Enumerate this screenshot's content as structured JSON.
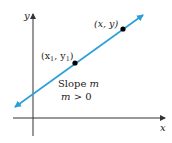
{
  "figure": {
    "axes": {
      "x_label": "x",
      "y_label": "y",
      "color": "#333333"
    },
    "line": {
      "color": "#2a9fd8",
      "direction": "positive slope, arrows both ends"
    },
    "points": [
      {
        "label_pre": "(x",
        "label_sub": "1",
        "label_mid": ", y",
        "label_sub2": "1",
        "label_post": ")"
      },
      {
        "label": "(x, y)"
      }
    ],
    "annotation": {
      "line1_text": "Slope ",
      "line1_var": "m",
      "line2_var": "m",
      "line2_text": " > 0"
    }
  }
}
